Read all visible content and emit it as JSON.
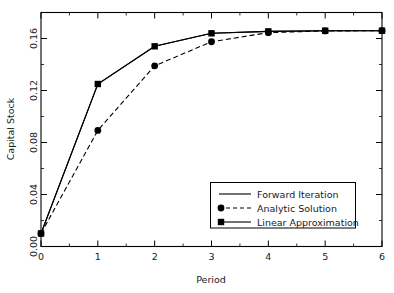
{
  "chart_data": {
    "type": "line",
    "title": "",
    "xlabel": "Period",
    "ylabel": "Capital Stock",
    "x": [
      0,
      1,
      2,
      3,
      4,
      5,
      6
    ],
    "xlim": [
      0,
      6
    ],
    "ylim": [
      0.0,
      0.18
    ],
    "xticks": [
      0,
      1,
      2,
      3,
      4,
      5,
      6
    ],
    "xtick_labels": [
      "0",
      "1",
      "2",
      "3",
      "4",
      "5",
      "6"
    ],
    "yticks": [
      0.0,
      0.04,
      0.08,
      0.12,
      0.16
    ],
    "ytick_labels": [
      "0.00",
      "0.04",
      "0.08",
      "0.12",
      "0.16"
    ],
    "grid": false,
    "legend_position": "lower right",
    "series": [
      {
        "name": "Forward Iteration",
        "marker": "none",
        "linestyle": "solid",
        "values": [
          0.01,
          0.125,
          0.154,
          0.164,
          0.1655,
          0.166,
          0.166
        ]
      },
      {
        "name": "Analytic Solution",
        "marker": "circle",
        "linestyle": "dashed",
        "values": [
          0.01,
          0.0893,
          0.139,
          0.1575,
          0.1645,
          0.1658,
          0.166
        ]
      },
      {
        "name": "Linear Approximation",
        "marker": "square",
        "linestyle": "solid",
        "values": [
          0.01,
          0.125,
          0.154,
          0.164,
          0.1655,
          0.166,
          0.166
        ]
      }
    ]
  },
  "legend": {
    "entries": [
      {
        "label": "Forward Iteration",
        "marker": "none",
        "linestyle": "solid"
      },
      {
        "label": "Analytic Solution",
        "marker": "circle",
        "linestyle": "dashed"
      },
      {
        "label": "Linear Approximation",
        "marker": "square",
        "linestyle": "solid"
      }
    ]
  },
  "colors": {
    "line": "#000000",
    "marker": "#000000",
    "frame": "#000000",
    "background": "#ffffff",
    "text": "#1a1a1a"
  }
}
